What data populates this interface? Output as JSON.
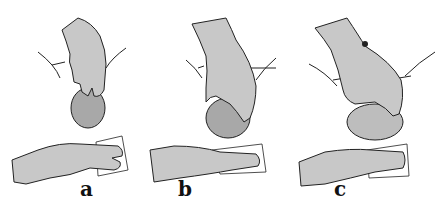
{
  "figure": {
    "panels": [
      {
        "label": "a",
        "caption_visible": false
      },
      {
        "label": "b",
        "caption_visible": false
      },
      {
        "label": "c",
        "caption_visible": false
      }
    ]
  },
  "colors": {
    "glove": "#c8c8c8",
    "outline": "#222222",
    "pad": "#ffffff",
    "head": "#9a9a9a",
    "background": "#ffffff"
  }
}
